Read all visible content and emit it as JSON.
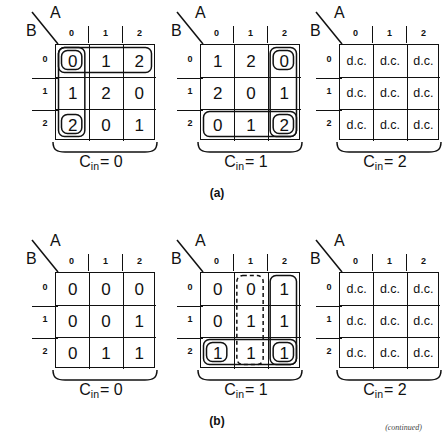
{
  "figure": {
    "part_a_label": "(a)",
    "part_b_label": "(b)",
    "continued_note": "(continued)",
    "axis": {
      "column_var": "A",
      "row_var": "B"
    },
    "column_headers": [
      "0",
      "1",
      "2"
    ],
    "row_headers": [
      "0",
      "1",
      "2"
    ],
    "carry_symbol": "C",
    "carry_subscript": "in"
  },
  "chart_data": {
    "type": "table",
    "xlabel": "A",
    "ylabel": "B",
    "categories": [
      "0",
      "1",
      "2"
    ],
    "maps": [
      {
        "part": "(a)",
        "caption_value": "0",
        "caption_text": "Cin= 0",
        "rows": [
          [
            "0",
            "1",
            "2"
          ],
          [
            "1",
            "2",
            "0"
          ],
          [
            "2",
            "0",
            "1"
          ]
        ],
        "loops": [
          {
            "style": "solid",
            "kind": "row",
            "row": 0,
            "cols": [
              0,
              2
            ]
          },
          {
            "style": "solid",
            "kind": "cell",
            "row": 0,
            "cols": [
              0,
              0
            ]
          },
          {
            "style": "solid",
            "kind": "column",
            "col": 0,
            "rows": [
              0,
              2
            ]
          },
          {
            "style": "solid",
            "kind": "cell",
            "row": 2,
            "cols": [
              0,
              0
            ]
          }
        ]
      },
      {
        "part": "(a)",
        "caption_value": "1",
        "caption_text": "Cin= 1",
        "rows": [
          [
            "1",
            "2",
            "0"
          ],
          [
            "2",
            "0",
            "1"
          ],
          [
            "0",
            "1",
            "2"
          ]
        ],
        "loops": [
          {
            "style": "solid",
            "kind": "column",
            "col": 2,
            "rows": [
              0,
              2
            ]
          },
          {
            "style": "solid",
            "kind": "cell",
            "row": 0,
            "cols": [
              2,
              2
            ]
          },
          {
            "style": "solid",
            "kind": "row",
            "row": 2,
            "cols": [
              0,
              2
            ]
          },
          {
            "style": "solid",
            "kind": "cell",
            "row": 2,
            "cols": [
              2,
              2
            ]
          }
        ]
      },
      {
        "part": "(a)",
        "caption_value": "2",
        "caption_text": "Cin= 2",
        "rows": [
          [
            "d.c.",
            "d.c.",
            "d.c."
          ],
          [
            "d.c.",
            "d.c.",
            "d.c."
          ],
          [
            "d.c.",
            "d.c.",
            "d.c."
          ]
        ],
        "loops": []
      },
      {
        "part": "(b)",
        "caption_value": "0",
        "caption_text": "Cin= 0",
        "rows": [
          [
            "0",
            "0",
            "0"
          ],
          [
            "0",
            "0",
            "1"
          ],
          [
            "0",
            "1",
            "1"
          ]
        ],
        "loops": []
      },
      {
        "part": "(b)",
        "caption_value": "1",
        "caption_text": "Cin= 1",
        "rows": [
          [
            "0",
            "0",
            "1"
          ],
          [
            "0",
            "1",
            "1"
          ],
          [
            "1",
            "1",
            "1"
          ]
        ],
        "loops": [
          {
            "style": "solid",
            "kind": "column",
            "col": 2,
            "rows": [
              0,
              2
            ]
          },
          {
            "style": "dashed",
            "kind": "column",
            "col": 1,
            "rows": [
              0,
              2
            ]
          },
          {
            "style": "solid",
            "kind": "row",
            "row": 2,
            "cols": [
              0,
              2
            ]
          },
          {
            "style": "solid",
            "kind": "cell",
            "row": 2,
            "cols": [
              0,
              0
            ]
          },
          {
            "style": "solid",
            "kind": "cell",
            "row": 2,
            "cols": [
              2,
              2
            ]
          }
        ]
      },
      {
        "part": "(b)",
        "caption_value": "2",
        "caption_text": "Cin= 2",
        "rows": [
          [
            "d.c.",
            "d.c.",
            "d.c."
          ],
          [
            "d.c.",
            "d.c.",
            "d.c."
          ],
          [
            "d.c.",
            "d.c.",
            "d.c."
          ]
        ],
        "loops": []
      }
    ]
  }
}
